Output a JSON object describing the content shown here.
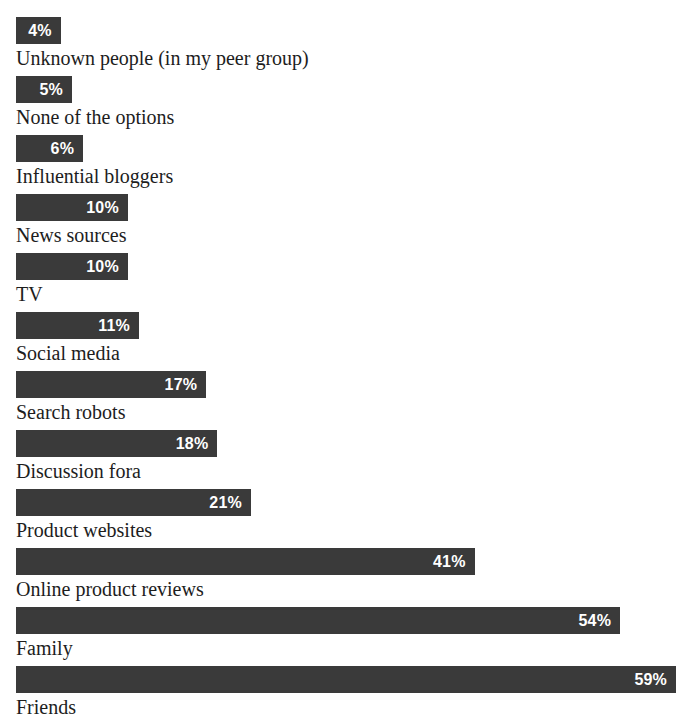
{
  "chart_data": {
    "type": "bar",
    "orientation": "horizontal",
    "title": "",
    "subtitle": "",
    "xlabel": "",
    "ylabel": "",
    "xlim": [
      0,
      59
    ],
    "grid": false,
    "legend": null,
    "value_suffix": "%",
    "categories": [
      "Unknown people (in my peer group)",
      "None of the options",
      "Influential bloggers",
      "News sources",
      "TV",
      "Social media",
      "Search robots",
      "Discussion fora",
      "Product websites",
      "Online product reviews",
      "Family",
      "Friends"
    ],
    "values": [
      4,
      5,
      6,
      10,
      10,
      11,
      17,
      18,
      21,
      41,
      54,
      59
    ],
    "value_labels": [
      "4%",
      "5%",
      "6%",
      "10%",
      "10%",
      "11%",
      "17%",
      "18%",
      "21%",
      "41%",
      "54%",
      "59%"
    ],
    "bar_color": "#3a3a3a",
    "value_label_color": "#ffffff",
    "category_label_color": "#1d1d1d",
    "background": "#ffffff"
  },
  "rows": [
    {
      "label": "Unknown people (in my peer group)",
      "value": 4,
      "value_label": "4%"
    },
    {
      "label": "None of the options",
      "value": 5,
      "value_label": "5%"
    },
    {
      "label": "Influential bloggers",
      "value": 6,
      "value_label": "6%"
    },
    {
      "label": "News sources",
      "value": 10,
      "value_label": "10%"
    },
    {
      "label": "TV",
      "value": 10,
      "value_label": "10%"
    },
    {
      "label": "Social media",
      "value": 11,
      "value_label": "11%"
    },
    {
      "label": "Search robots",
      "value": 17,
      "value_label": "17%"
    },
    {
      "label": "Discussion fora",
      "value": 18,
      "value_label": "18%"
    },
    {
      "label": "Product websites",
      "value": 21,
      "value_label": "21%"
    },
    {
      "label": "Online product reviews",
      "value": 41,
      "value_label": "41%"
    },
    {
      "label": "Family",
      "value": 54,
      "value_label": "54%"
    },
    {
      "label": "Friends",
      "value": 59,
      "value_label": "59%"
    }
  ],
  "layout": {
    "plot_left_px": 16,
    "plot_top_px": 17,
    "plot_width_px": 660,
    "row_pitch_px": 59,
    "bar_height_px": 27,
    "max_value": 59
  }
}
